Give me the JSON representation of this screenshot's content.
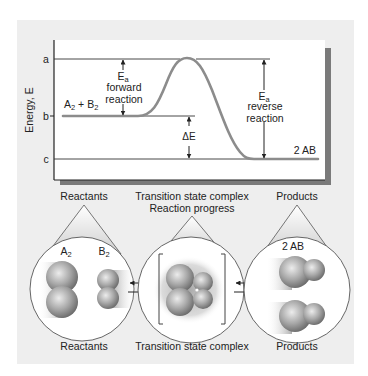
{
  "energy_diagram": {
    "y_axis_label": "Energy, E",
    "levels": {
      "a": {
        "label": "a"
      },
      "b": {
        "label": "b"
      },
      "c": {
        "label": "c"
      }
    },
    "reactant_label": {
      "main": "A",
      "sub1": "2",
      "plus": " + B",
      "sub2": "2"
    },
    "product_label": "2 AB",
    "forward_ea": {
      "E": "E",
      "sub": "a",
      "line1": "forward",
      "line2": "reaction"
    },
    "reverse_ea": {
      "E": "E",
      "sub": "a",
      "line1": "reverse",
      "line2": "reaction"
    },
    "delta_e": "ΔE",
    "x_axis_label": "Reaction progress"
  },
  "stages": [
    {
      "top_label": "Reactants",
      "bottom_label": "Reactants",
      "molecules": [
        {
          "name": "A",
          "sub": "2"
        },
        {
          "name": "B",
          "sub": "2"
        }
      ]
    },
    {
      "top_label": "Transition state complex",
      "bottom_label": "Transition state complex"
    },
    {
      "top_label": "Products",
      "bottom_label": "Products",
      "molecule_label": "2 AB"
    }
  ],
  "colors": {
    "panel_bg": "#eeeeee",
    "chart_bg": "#ffffff",
    "shadow": "#7a7a7a",
    "line": "#333333",
    "curve": "#8c8c8c",
    "sphere_light": "#e0e0e0",
    "sphere_dark": "#6e6e6e"
  }
}
